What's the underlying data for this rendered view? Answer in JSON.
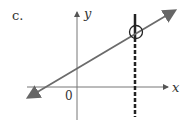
{
  "figure": {
    "part_label": "c.",
    "x_axis_label": "x",
    "y_axis_label": "y",
    "origin_label": "0",
    "colors": {
      "line": "#6b6b6b",
      "axes": "#555555",
      "vertical_line": "#222222"
    }
  }
}
